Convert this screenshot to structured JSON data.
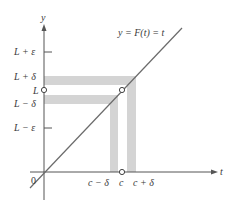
{
  "figure": {
    "function_label": "y = F(t) = t",
    "axes": {
      "x_label": "t",
      "y_label": "y",
      "origin_label": "0"
    },
    "y_ticks": [
      {
        "id": "l_plus_eps",
        "label": "L + ε",
        "y": 52,
        "tick": true
      },
      {
        "id": "l_plus_delta",
        "label": "L + δ",
        "y": 76,
        "tick": false
      },
      {
        "id": "l",
        "label": "L",
        "y": 90,
        "tick": false
      },
      {
        "id": "l_minus_delta",
        "label": "L − δ",
        "y": 104,
        "tick": false
      },
      {
        "id": "l_minus_eps",
        "label": "L − ε",
        "y": 128,
        "tick": true
      }
    ],
    "x_ticks": [
      {
        "id": "c_minus_delta",
        "label": "c − δ",
        "x": 110
      },
      {
        "id": "c",
        "label": "c",
        "x": 122
      },
      {
        "id": "c_plus_delta",
        "label": "c + δ",
        "x": 136
      }
    ],
    "bands": {
      "horizontal_upper": "between L and L + δ",
      "horizontal_lower": "between L − δ and L",
      "vertical_left": "between c − δ and c",
      "vertical_right": "between c and c + δ"
    },
    "open_points": [
      {
        "id": "limit-point",
        "description": "(c, L)"
      },
      {
        "id": "y-axis-L-point",
        "description": "(0, L)"
      },
      {
        "id": "x-axis-c-point",
        "description": "(c, 0)"
      }
    ],
    "colors": {
      "band": "#d4d4d4",
      "axis": "#555555",
      "line": "#6b6b6b",
      "text": "#3a3a3a"
    }
  }
}
